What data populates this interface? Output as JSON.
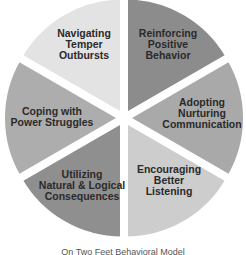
{
  "diagram": {
    "type": "segmented-wheel",
    "center": [
      124,
      118
    ],
    "radius": 117,
    "explode_px": 4,
    "background": "#ffffff",
    "text_color": "#2a2a2a",
    "segments": [
      {
        "id": "reinforcing",
        "start_deg": 0,
        "end_deg": 60,
        "color": "#8c8c8c",
        "lines": [
          "Reinforcing",
          "Positive",
          "Behavior"
        ],
        "label_pos": [
          168,
          44
        ]
      },
      {
        "id": "adopting",
        "start_deg": 60,
        "end_deg": 120,
        "color": "#a9a9a9",
        "lines": [
          "Adopting",
          "Nurturing",
          "Communication"
        ],
        "label_pos": [
          202,
          113
        ]
      },
      {
        "id": "encouraging",
        "start_deg": 120,
        "end_deg": 180,
        "color": "#cdcdcd",
        "lines": [
          "Encouraging",
          "Better",
          "Listening"
        ],
        "label_pos": [
          169,
          180
        ]
      },
      {
        "id": "utilizing",
        "start_deg": 180,
        "end_deg": 240,
        "color": "#8f8f8f",
        "lines": [
          "Utilizing",
          "Natural & Logical",
          "Consequences"
        ],
        "label_pos": [
          82,
          185
        ]
      },
      {
        "id": "coping",
        "start_deg": 240,
        "end_deg": 300,
        "color": "#adadad",
        "lines": [
          "Coping with",
          "Power Struggles"
        ],
        "label_pos": [
          52,
          116
        ]
      },
      {
        "id": "navigating",
        "start_deg": 300,
        "end_deg": 360,
        "color": "#e3e3e3",
        "lines": [
          "Navigating",
          "Temper",
          "Outbursts"
        ],
        "label_pos": [
          84,
          44
        ]
      }
    ]
  },
  "caption": "On Two Feet Behavioral Model"
}
